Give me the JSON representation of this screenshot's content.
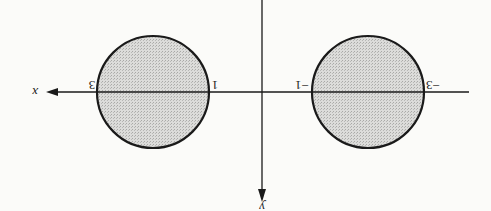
{
  "figure": {
    "orientation": "rotated 180 degrees",
    "axes": {
      "x_label": "x",
      "y_label": "y"
    },
    "regions": [
      {
        "name": "left-disk",
        "x_min": 1,
        "x_max": 3,
        "left_label": "1",
        "right_label": "3"
      },
      {
        "name": "right-disk",
        "x_min": -3,
        "x_max": -1,
        "left_label": "-3",
        "right_label": "-1"
      }
    ],
    "colors": {
      "ink": "#1a1a1a",
      "fill": "#d4d4d2",
      "background": "#fbfbf9"
    }
  }
}
